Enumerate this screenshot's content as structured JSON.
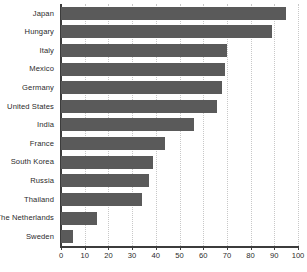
{
  "chart_data": {
    "type": "bar",
    "orientation": "horizontal",
    "title": "",
    "subtitle": "",
    "xlabel": "",
    "ylabel": "",
    "xlim": [
      0,
      100
    ],
    "xticks": [
      0,
      10,
      20,
      30,
      40,
      50,
      60,
      70,
      80,
      90,
      100
    ],
    "xtick_labels": [
      "0",
      "10",
      "20",
      "30",
      "40",
      "50",
      "60",
      "70",
      "80",
      "90",
      "100"
    ],
    "grid": true,
    "grid_axis": "x",
    "legend": null,
    "categories": [
      "Japan",
      "Hungary",
      "Italy",
      "Mexico",
      "Germany",
      "United States",
      "India",
      "France",
      "South Korea",
      "Russia",
      "Thailand",
      "The Netherlands",
      "Sweden"
    ],
    "values": [
      95,
      89,
      70,
      69,
      68,
      66,
      56,
      44,
      39,
      37,
      34,
      15,
      5
    ],
    "bar_color": "#5a5a5a",
    "axis_color": "#3c3c3c",
    "grid_color": "#c8c8c8",
    "background_color": "#ffffff"
  }
}
